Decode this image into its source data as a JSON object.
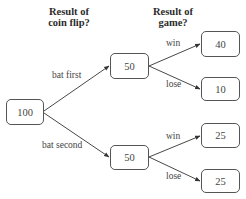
{
  "headers": {
    "coin_flip": {
      "line1": "Result of",
      "line2": "coin flip?"
    },
    "game": {
      "line1": "Result of",
      "line2": "game?"
    }
  },
  "nodes": {
    "root": {
      "value": "100"
    },
    "bat_first": {
      "value": "50"
    },
    "bat_second": {
      "value": "50"
    },
    "bat_first_win": {
      "value": "40"
    },
    "bat_first_lose": {
      "value": "10"
    },
    "bat_second_win": {
      "value": "25"
    },
    "bat_second_lose": {
      "value": "25"
    }
  },
  "edges": {
    "bat_first": {
      "label": "bat first"
    },
    "bat_second": {
      "label": "bat second"
    },
    "first_win": {
      "label": "win"
    },
    "first_lose": {
      "label": "lose"
    },
    "second_win": {
      "label": "win"
    },
    "second_lose": {
      "label": "lose"
    }
  },
  "colors": {
    "line": "#333333",
    "node_border": "#555555",
    "text": "#444444"
  }
}
